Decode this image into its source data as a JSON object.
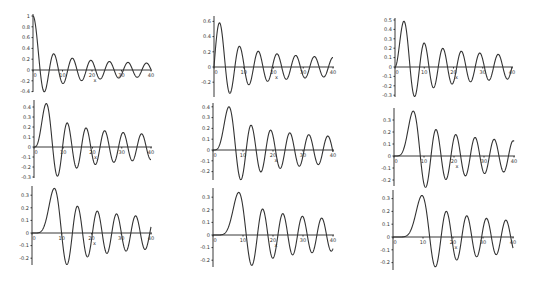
{
  "chart_data": [
    {
      "type": "line",
      "function": "BesselJ",
      "order": 0,
      "xlabel": "x",
      "xlim": [
        0,
        40
      ],
      "ylim": [
        -0.4,
        1.0
      ],
      "xticks": [
        0,
        10,
        20,
        30,
        40
      ],
      "xtick_labels": [
        "0",
        "10",
        "20",
        "30",
        "40"
      ],
      "yticks": [
        1,
        0.8,
        0.6,
        0.4,
        0.2,
        0,
        -0.2,
        -0.4
      ],
      "ytick_labels": [
        "1",
        "0.8",
        "0.6",
        "0.4",
        "0.2",
        "0",
        "-0.2",
        "-0.4"
      ],
      "grid": false,
      "frame": {
        "x0": 33,
        "x40": 151,
        "y_zero": 70,
        "px_per_unit": 54,
        "y_top": 14,
        "y_bottom": 92
      }
    },
    {
      "type": "line",
      "function": "BesselJ",
      "order": 1,
      "xlabel": "x",
      "xlim": [
        0,
        40
      ],
      "ylim": [
        -0.3,
        0.6
      ],
      "xticks": [
        0,
        10,
        20,
        30,
        40
      ],
      "xtick_labels": [
        "0",
        "10",
        "20",
        "30",
        "40"
      ],
      "yticks": [
        0.6,
        0.4,
        0.2,
        0,
        -0.2
      ],
      "ytick_labels": [
        "0.6",
        "0.4",
        "0.2",
        "0",
        "-0.2"
      ],
      "grid": false,
      "frame": {
        "x0": 214,
        "x40": 333,
        "y_zero": 67,
        "px_per_unit": 76,
        "y_top": 16,
        "y_bottom": 97
      }
    },
    {
      "type": "line",
      "function": "BesselJ",
      "order": 2,
      "xlabel": "x",
      "xlim": [
        0,
        40
      ],
      "ylim": [
        -0.3,
        0.5
      ],
      "xticks": [
        0,
        10,
        20,
        30,
        40
      ],
      "xtick_labels": [
        "0",
        "10",
        "20",
        "30",
        "40"
      ],
      "yticks": [
        0.5,
        0.4,
        0.3,
        0.2,
        0.1,
        0,
        -0.1,
        -0.2,
        -0.3
      ],
      "ytick_labels": [
        "0.5",
        "0.4",
        "0.3",
        "0.2",
        "0.1",
        "0",
        "-0.1",
        "-0.2",
        "-0.3"
      ],
      "grid": false,
      "frame": {
        "x0": 395,
        "x40": 512,
        "y_zero": 67,
        "px_per_unit": 94,
        "y_top": 18,
        "y_bottom": 97
      }
    },
    {
      "type": "line",
      "function": "BesselJ",
      "order": 3,
      "xlabel": "x",
      "xlim": [
        0,
        40
      ],
      "ylim": [
        -0.3,
        0.4
      ],
      "xticks": [
        0,
        10,
        20,
        30,
        40
      ],
      "xtick_labels": [
        "0",
        "10",
        "20",
        "30",
        "40"
      ],
      "yticks": [
        0.4,
        0.3,
        0.2,
        0.1,
        0,
        -0.1,
        -0.2,
        -0.3
      ],
      "ytick_labels": [
        "0.4",
        "0.3",
        "0.2",
        "0.1",
        "0",
        "-0.1",
        "-0.2",
        "-0.3"
      ],
      "grid": false,
      "frame": {
        "x0": 34,
        "x40": 151,
        "y_zero": 147,
        "px_per_unit": 100,
        "y_top": 100,
        "y_bottom": 178
      }
    },
    {
      "type": "line",
      "function": "BesselJ",
      "order": 4,
      "xlabel": "x",
      "xlim": [
        0,
        40
      ],
      "ylim": [
        -0.25,
        0.4
      ],
      "xticks": [
        0,
        10,
        20,
        30,
        40
      ],
      "xtick_labels": [
        "0",
        "10",
        "20",
        "30",
        "40"
      ],
      "yticks": [
        0.4,
        0.3,
        0.2,
        0.1,
        0,
        -0.1,
        -0.2
      ],
      "ytick_labels": [
        "0.4",
        "0.3",
        "0.2",
        "0.1",
        "0",
        "-0.1",
        "-0.2"
      ],
      "grid": false,
      "frame": {
        "x0": 213,
        "x40": 333,
        "y_zero": 150,
        "px_per_unit": 108,
        "y_top": 103,
        "y_bottom": 180
      }
    },
    {
      "type": "line",
      "function": "BesselJ",
      "order": 5,
      "xlabel": "x",
      "xlim": [
        0,
        40
      ],
      "ylim": [
        -0.25,
        0.35
      ],
      "xticks": [
        0,
        10,
        20,
        30,
        40
      ],
      "xtick_labels": [
        "0",
        "10",
        "20",
        "30",
        "40"
      ],
      "yticks": [
        0.3,
        0.2,
        0.1,
        0,
        -0.1,
        -0.2
      ],
      "ytick_labels": [
        "0.3",
        "0.2",
        "0.1",
        "0",
        "-0.1",
        "-0.2"
      ],
      "grid": false,
      "frame": {
        "x0": 394,
        "x40": 514,
        "y_zero": 156,
        "px_per_unit": 120,
        "y_top": 108,
        "y_bottom": 186
      }
    },
    {
      "type": "line",
      "function": "BesselJ",
      "order": 6,
      "xlabel": "x",
      "xlim": [
        0,
        40
      ],
      "ylim": [
        -0.25,
        0.35
      ],
      "xticks": [
        0,
        10,
        20,
        30,
        40
      ],
      "xtick_labels": [
        "0",
        "10",
        "20",
        "30",
        "40"
      ],
      "yticks": [
        0.3,
        0.2,
        0.1,
        0,
        -0.1,
        -0.2
      ],
      "ytick_labels": [
        "0.3",
        "0.2",
        "0.1",
        "0",
        "-0.1",
        "-0.2"
      ],
      "grid": false,
      "frame": {
        "x0": 32,
        "x40": 151,
        "y_zero": 233,
        "px_per_unit": 126,
        "y_top": 186,
        "y_bottom": 265
      }
    },
    {
      "type": "line",
      "function": "BesselJ",
      "order": 7,
      "xlabel": "x",
      "xlim": [
        0,
        40
      ],
      "ylim": [
        -0.25,
        0.35
      ],
      "xticks": [
        0,
        10,
        20,
        30,
        40
      ],
      "xtick_labels": [
        "0",
        "10",
        "20",
        "30",
        "40"
      ],
      "yticks": [
        0.3,
        0.2,
        0.1,
        0,
        -0.1,
        -0.2
      ],
      "ytick_labels": [
        "0.3",
        "0.2",
        "0.1",
        "0",
        "-0.1",
        "-0.2"
      ],
      "grid": false,
      "frame": {
        "x0": 213,
        "x40": 333,
        "y_zero": 235,
        "px_per_unit": 126,
        "y_top": 188,
        "y_bottom": 267
      }
    },
    {
      "type": "line",
      "function": "BesselJ",
      "order": 8,
      "xlabel": "x",
      "xlim": [
        0,
        40
      ],
      "ylim": [
        -0.25,
        0.35
      ],
      "xticks": [
        0,
        10,
        20,
        30,
        40
      ],
      "xtick_labels": [
        "0",
        "10",
        "20",
        "30",
        "40"
      ],
      "yticks": [
        0.3,
        0.2,
        0.1,
        0,
        -0.1,
        -0.2
      ],
      "ytick_labels": [
        "0.3",
        "0.2",
        "0.1",
        "0",
        "-0.1",
        "-0.2"
      ],
      "grid": false,
      "frame": {
        "x0": 393,
        "x40": 513,
        "y_zero": 237,
        "px_per_unit": 128,
        "y_top": 190,
        "y_bottom": 270
      }
    }
  ],
  "style": {
    "line_color": "#333333",
    "axis_color": "#222222",
    "background": "#ffffff"
  }
}
